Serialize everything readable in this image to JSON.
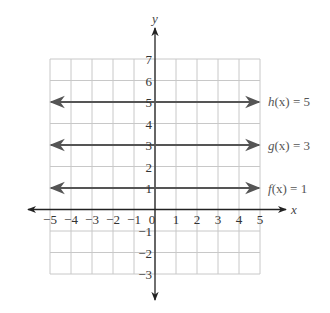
{
  "chart_data": {
    "type": "line",
    "title": "",
    "xlabel": "x",
    "ylabel": "y",
    "xlim": [
      -5,
      5
    ],
    "ylim": [
      -3,
      7
    ],
    "grid": true,
    "x_ticks": [
      "-5",
      "-4",
      "-3",
      "-2",
      "-1",
      "0",
      "1",
      "2",
      "3",
      "4",
      "5"
    ],
    "y_ticks": [
      "7",
      "6",
      "5",
      "4",
      "3",
      "2",
      "1",
      "-1",
      "-2",
      "-3"
    ],
    "series": [
      {
        "name": "h(x) = 5",
        "x": [
          -5,
          5
        ],
        "values": [
          5,
          5
        ]
      },
      {
        "name": "g(x) = 3",
        "x": [
          -5,
          5
        ],
        "values": [
          3,
          3
        ]
      },
      {
        "name": "f(x) = 1",
        "x": [
          -5,
          5
        ],
        "values": [
          1,
          1
        ]
      }
    ]
  },
  "labels": {
    "x_axis": "x",
    "y_axis": "y",
    "h": {
      "name": "h",
      "arg": "(x)",
      "rhs": " = 5"
    },
    "g": {
      "name": "g",
      "arg": "(x)",
      "rhs": " = 3"
    },
    "f": {
      "name": "f",
      "arg": "(x)",
      "rhs": " = 1"
    }
  }
}
